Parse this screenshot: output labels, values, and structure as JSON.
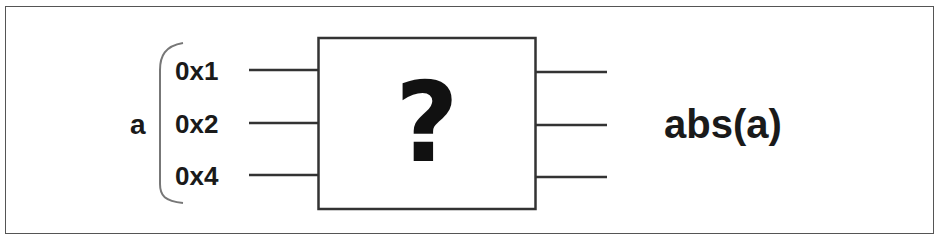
{
  "diagram": {
    "input_variable": "a",
    "input_bits": [
      "0x1",
      "0x2",
      "0x4"
    ],
    "black_box_label": "?",
    "output_label": "abs(a)",
    "output_line_count": 3,
    "colors": {
      "stroke": "#333333",
      "text": "#1a1a1a",
      "background": "#ffffff"
    }
  }
}
